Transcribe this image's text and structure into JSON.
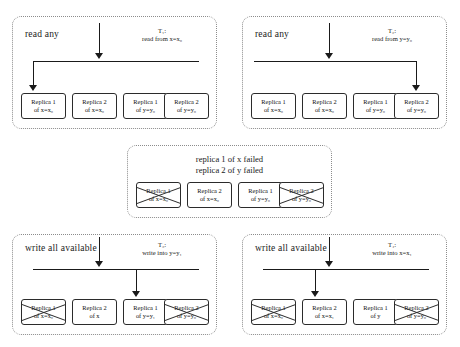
{
  "diagram": {
    "panels": [
      {
        "id": "read-any-x",
        "title": "read any",
        "transaction": "T₁:",
        "operation": "read from x=x₀",
        "boxes": [
          {
            "line1": "Replica 1",
            "line2": "of x=x₀",
            "failed": false,
            "target": true
          },
          {
            "line1": "Replica 2",
            "line2": "of x=x₀",
            "failed": false,
            "target": false
          },
          {
            "line1": "Replica 1",
            "line2": "of y=y₀",
            "failed": false,
            "target": false
          },
          {
            "line1": "Replica 2",
            "line2": "of y=y₀",
            "failed": false,
            "target": false
          }
        ]
      },
      {
        "id": "read-any-y",
        "title": "read any",
        "transaction": "T₂:",
        "operation": "read from y=y₀",
        "boxes": [
          {
            "line1": "Replica 1",
            "line2": "of x=x₀",
            "failed": false,
            "target": false
          },
          {
            "line1": "Replica 2",
            "line2": "of x=x₀",
            "failed": false,
            "target": false
          },
          {
            "line1": "Replica 1",
            "line2": "of y=y₀",
            "failed": false,
            "target": false
          },
          {
            "line1": "Replica 2",
            "line2": "of y=y₀",
            "failed": false,
            "target": true
          }
        ]
      },
      {
        "id": "failures",
        "note_line1": "replica 1 of x failed",
        "note_line2": "replica 2 of y failed",
        "boxes": [
          {
            "line1": "Replica 1",
            "line2": "of x=x₀",
            "failed": true,
            "target": false
          },
          {
            "line1": "Replica 2",
            "line2": "of x=x₀",
            "failed": false,
            "target": false
          },
          {
            "line1": "Replica 1",
            "line2": "of y=y₀",
            "failed": false,
            "target": false
          },
          {
            "line1": "Replica 2",
            "line2": "of y=y₀",
            "failed": true,
            "target": false
          }
        ]
      },
      {
        "id": "write-all-y",
        "title": "write all available",
        "transaction": "T₃:",
        "operation": "write into y=y₁",
        "boxes": [
          {
            "line1": "Replica 1",
            "line2": "of x=x₀",
            "failed": true,
            "target": false
          },
          {
            "line1": "Replica 2",
            "line2": "of x",
            "failed": false,
            "target": false
          },
          {
            "line1": "Replica 1",
            "line2": "of y=y₁",
            "failed": false,
            "target": true
          },
          {
            "line1": "Replica 2",
            "line2": "of y=y₀",
            "failed": true,
            "target": false
          }
        ]
      },
      {
        "id": "write-all-x",
        "title": "write all available",
        "transaction": "T₄:",
        "operation": "write into x=x₁",
        "boxes": [
          {
            "line1": "Replica 1",
            "line2": "of x=x₀",
            "failed": true,
            "target": false
          },
          {
            "line1": "Replica 2",
            "line2": "of x=x₁",
            "failed": false,
            "target": true
          },
          {
            "line1": "Replica 1",
            "line2": "of y",
            "failed": false,
            "target": false
          },
          {
            "line1": "Replica 2",
            "line2": "of y=y₀",
            "failed": true,
            "target": false
          }
        ]
      }
    ]
  }
}
